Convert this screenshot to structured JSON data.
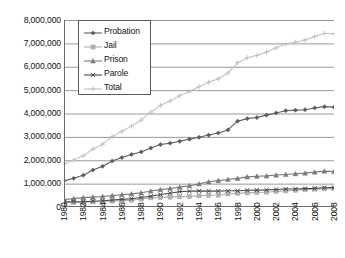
{
  "chart_data": {
    "type": "line",
    "title": "",
    "xlabel": "",
    "ylabel": "",
    "xlim": [
      1980,
      2008
    ],
    "ylim": [
      0,
      8000000
    ],
    "grid": true,
    "legend_position": "upper-left-inside",
    "y_ticks": [
      "0",
      "1,000,000",
      "2,000,000",
      "3,000,000",
      "4,000,000",
      "5,000,000",
      "6,000,000",
      "7,000,000",
      "8,000,000"
    ],
    "y_tick_values": [
      0,
      1000000,
      2000000,
      3000000,
      4000000,
      5000000,
      6000000,
      7000000,
      8000000
    ],
    "x_tick_labels": [
      "1980",
      "1982",
      "1984",
      "1986",
      "1988",
      "1990",
      "1992",
      "1994",
      "1996",
      "1998",
      "2000",
      "2002",
      "2004",
      "2006",
      "2008"
    ],
    "x": [
      1980,
      1981,
      1982,
      1983,
      1984,
      1985,
      1986,
      1987,
      1988,
      1989,
      1990,
      1991,
      1992,
      1993,
      1994,
      1995,
      1996,
      1997,
      1998,
      1999,
      2000,
      2001,
      2002,
      2003,
      2004,
      2005,
      2006,
      2007,
      2008
    ],
    "series": [
      {
        "name": "Probation",
        "marker": "diamond",
        "color": "#5b5b5b",
        "values": [
          1118097,
          1225934,
          1357264,
          1582947,
          1740948,
          1968712,
          2114621,
          2247158,
          2356483,
          2522125,
          2670234,
          2728472,
          2811611,
          2903061,
          2981022,
          3077861,
          3164996,
          3296513,
          3670441,
          3779922,
          3826209,
          3931731,
          4024067,
          4120012,
          4143792,
          4162536,
          4236800,
          4293163,
          4270917
        ]
      },
      {
        "name": "Jail",
        "marker": "square",
        "color": "#b0b0b0",
        "values": [
          182288,
          195085,
          207853,
          221815,
          233018,
          254986,
          272736,
          294092,
          341893,
          393303,
          403019,
          424129,
          441781,
          455500,
          479800,
          499300,
          510400,
          557974,
          584372,
          605943,
          621149,
          631240,
          665475,
          691301,
          713990,
          747529,
          765819,
          780174,
          785556
        ]
      },
      {
        "name": "Prison",
        "marker": "triangle",
        "color": "#7a7a7a",
        "values": [
          319598,
          360029,
          402914,
          423898,
          448264,
          487593,
          526436,
          562814,
          607766,
          683367,
          743382,
          792535,
          850566,
          909381,
          990147,
          1078542,
          1127528,
          1176564,
          1224469,
          1287172,
          1316333,
          1330007,
          1367547,
          1390279,
          1421345,
          1448344,
          1492973,
          1532817,
          1518559
        ]
      },
      {
        "name": "Parole",
        "marker": "x",
        "color": "#4a4a4a",
        "values": [
          220438,
          225539,
          224604,
          246440,
          266992,
          300203,
          325638,
          355505,
          407977,
          456803,
          531407,
          590442,
          658601,
          676100,
          690371,
          679421,
          679733,
          694787,
          696385,
          714457,
          723898,
          732333,
          750934,
          769925,
          771852,
          784354,
          798202,
          824365,
          828169
        ]
      },
      {
        "name": "Total",
        "marker": "plus",
        "color": "#c2c2c2",
        "values": [
          1840400,
          2006587,
          2192635,
          2475100,
          2689222,
          3011494,
          3239431,
          3459569,
          3714119,
          4055598,
          4348042,
          4535578,
          4762559,
          4944042,
          5141340,
          5335124,
          5482657,
          5725838,
          6175667,
          6387494,
          6487589,
          6625311,
          6808023,
          6971517,
          7050979,
          7142763,
          7293763,
          7430522,
          7403201
        ]
      }
    ]
  },
  "legend": {
    "items": [
      {
        "label": "Probation",
        "marker": "diamond-marker-icon"
      },
      {
        "label": "Jail",
        "marker": "square-marker-icon"
      },
      {
        "label": "Prison",
        "marker": "triangle-marker-icon"
      },
      {
        "label": "Parole",
        "marker": "x-marker-icon"
      },
      {
        "label": "Total",
        "marker": "plus-marker-icon"
      }
    ]
  }
}
